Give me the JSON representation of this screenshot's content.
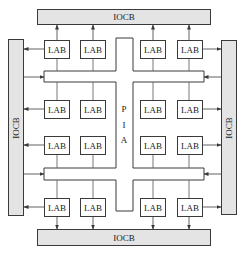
{
  "diagram": {
    "iocb": {
      "top": "IOCB",
      "bottom": "IOCB",
      "left": "IOCB",
      "right": "IOCB"
    },
    "pia": {
      "letters": [
        "P",
        "I",
        "A"
      ]
    },
    "labs": {
      "row1": [
        "LAB",
        "LAB",
        "LAB",
        "LAB"
      ],
      "row2": [
        "LAB",
        "LAB",
        "LAB",
        "LAB"
      ],
      "row3": [
        "LAB",
        "LAB",
        "LAB",
        "LAB"
      ],
      "row4": [
        "LAB",
        "LAB",
        "LAB",
        "LAB"
      ]
    },
    "colors": {
      "iocb_fill": "#e4e4e4",
      "line": "#3a3a3a",
      "background": "#ffffff"
    }
  }
}
